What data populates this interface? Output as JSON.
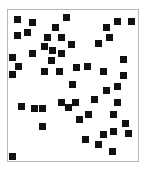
{
  "canvas": {
    "width": 148,
    "height": 172,
    "frame": {
      "x": 7,
      "y": 9,
      "width": 132,
      "height": 153,
      "border_color": "#b8b8b8"
    },
    "square_color": "#111111",
    "square_size": 7
  },
  "squares": [
    [
      17,
      19
    ],
    [
      32,
      22
    ],
    [
      66,
      17
    ],
    [
      55,
      27
    ],
    [
      27,
      32
    ],
    [
      17,
      35
    ],
    [
      47,
      37
    ],
    [
      61,
      37
    ],
    [
      44,
      46
    ],
    [
      52,
      50
    ],
    [
      71,
      44
    ],
    [
      32,
      53
    ],
    [
      61,
      53
    ],
    [
      51,
      60
    ],
    [
      12,
      57
    ],
    [
      18,
      66
    ],
    [
      12,
      74
    ],
    [
      44,
      71
    ],
    [
      59,
      71
    ],
    [
      76,
      67
    ],
    [
      87,
      66
    ],
    [
      103,
      71
    ],
    [
      72,
      84
    ],
    [
      117,
      21
    ],
    [
      131,
      21
    ],
    [
      106,
      27
    ],
    [
      109,
      37
    ],
    [
      98,
      43
    ],
    [
      123,
      59
    ],
    [
      123,
      75
    ],
    [
      117,
      86
    ],
    [
      106,
      90
    ],
    [
      94,
      99
    ],
    [
      117,
      102
    ],
    [
      21,
      106
    ],
    [
      34,
      108
    ],
    [
      42,
      108
    ],
    [
      61,
      102
    ],
    [
      68,
      107
    ],
    [
      75,
      102
    ],
    [
      42,
      126
    ],
    [
      88,
      114
    ],
    [
      79,
      119
    ],
    [
      113,
      114
    ],
    [
      125,
      123
    ],
    [
      113,
      131
    ],
    [
      128,
      133
    ],
    [
      103,
      134
    ],
    [
      85,
      139
    ],
    [
      98,
      144
    ],
    [
      112,
      151
    ],
    [
      12,
      156
    ]
  ]
}
